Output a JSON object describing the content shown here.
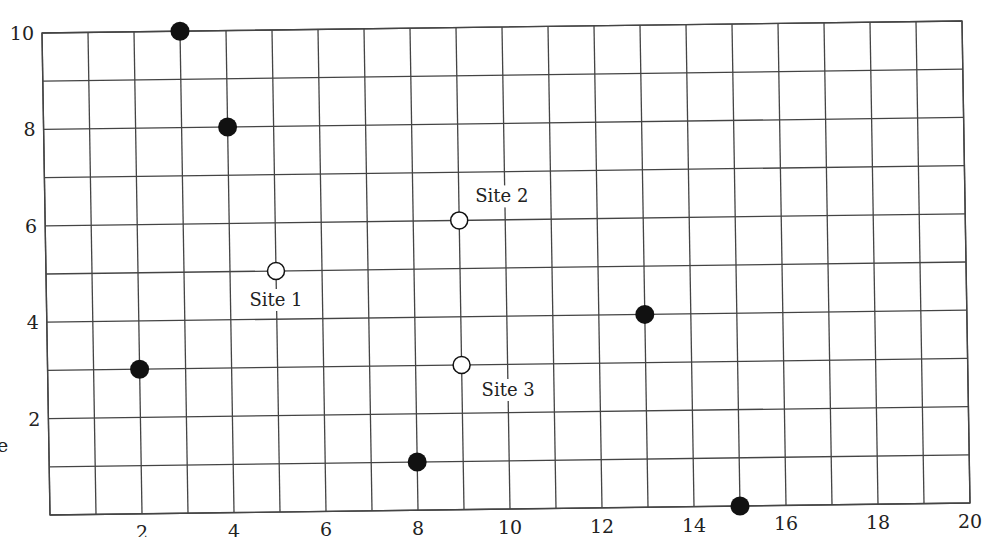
{
  "chart_data": {
    "type": "scatter",
    "title": "",
    "xlabel": "",
    "ylabel": "",
    "xlim": [
      0,
      20
    ],
    "ylim": [
      0,
      10
    ],
    "grid": true,
    "x_ticks": [
      2,
      4,
      6,
      8,
      10,
      12,
      14,
      16,
      18,
      20
    ],
    "y_ticks": [
      2,
      4,
      6,
      8,
      10
    ],
    "series": [
      {
        "name": "filled points",
        "marker": "filled-circle",
        "color": "#111111",
        "points": [
          {
            "x": 3,
            "y": 10
          },
          {
            "x": 4,
            "y": 8
          },
          {
            "x": 2,
            "y": 3
          },
          {
            "x": 8,
            "y": 1
          },
          {
            "x": 13,
            "y": 4
          },
          {
            "x": 15,
            "y": 0
          }
        ]
      },
      {
        "name": "sites",
        "marker": "open-circle",
        "color": "#111111",
        "points": [
          {
            "x": 5,
            "y": 5,
            "label": "Site 1",
            "label_pos": "below"
          },
          {
            "x": 9,
            "y": 6,
            "label": "Site 2",
            "label_pos": "above-right"
          },
          {
            "x": 9,
            "y": 3,
            "label": "Site 3",
            "label_pos": "below-right"
          }
        ]
      }
    ],
    "edge_text": "e"
  }
}
